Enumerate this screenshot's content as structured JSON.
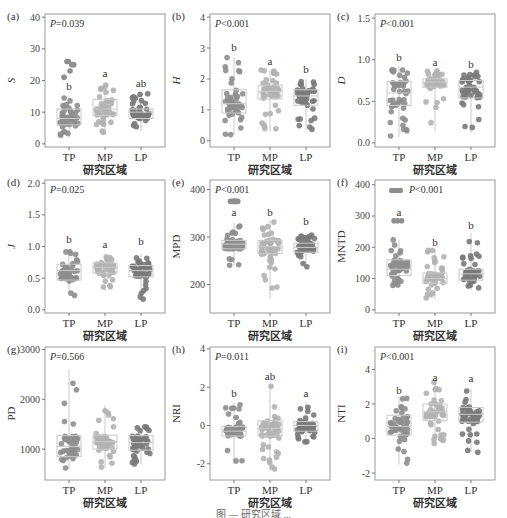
{
  "figure": {
    "xlabel": "研究区域",
    "groups": [
      "TP",
      "MP",
      "LP"
    ],
    "colors": {
      "TP": "#8e8e8e",
      "MP": "#b3b3b3",
      "LP": "#7a7a7a",
      "box": "#c9c9c9",
      "frame": "#9a9a9a"
    }
  },
  "chart_data": [
    {
      "panel": "(a)",
      "type": "box",
      "ylabel": "S",
      "ylabel_italic": true,
      "ylim": [
        -1,
        41
      ],
      "yticks": [
        0,
        10,
        20,
        30,
        40
      ],
      "yticklabels": [
        "0",
        "10",
        "20",
        "30",
        "40"
      ],
      "pvalue": "P=0.039",
      "categories": [
        "TP",
        "MP",
        "LP"
      ],
      "letters": [
        "b",
        "a",
        "ab"
      ],
      "letter_y": [
        17,
        21,
        18
      ],
      "box": [
        {
          "q1": 6,
          "median": 8,
          "q3": 11,
          "min": 2,
          "max": 15
        },
        {
          "q1": 9,
          "median": 11,
          "q3": 14,
          "min": 3,
          "max": 19
        },
        {
          "q1": 8,
          "median": 10,
          "q3": 11,
          "min": 4,
          "max": 16
        }
      ],
      "outliers": [
        [
          21,
          23,
          25,
          26,
          26,
          25
        ],
        [],
        []
      ]
    },
    {
      "panel": "(b)",
      "type": "box",
      "ylabel": "H",
      "ylabel_italic": true,
      "ylim": [
        -0.2,
        4.1
      ],
      "yticks": [
        0,
        1,
        2,
        3,
        4
      ],
      "yticklabels": [
        "0",
        "1",
        "2",
        "3",
        "4"
      ],
      "pvalue": "P<0.001",
      "categories": [
        "TP",
        "MP",
        "LP"
      ],
      "letters": [
        "b",
        "a",
        "b"
      ],
      "letter_y": [
        2.9,
        2.45,
        2.2
      ],
      "box": [
        {
          "q1": 0.9,
          "median": 1.2,
          "q3": 1.65,
          "min": 0.2,
          "max": 2.7
        },
        {
          "q1": 1.35,
          "median": 1.6,
          "q3": 1.8,
          "min": 0.3,
          "max": 2.3
        },
        {
          "q1": 1.15,
          "median": 1.45,
          "q3": 1.65,
          "min": 0.35,
          "max": 2.0
        }
      ],
      "outliers": [
        [],
        [],
        []
      ]
    },
    {
      "panel": "(c)",
      "type": "box",
      "ylabel": "D",
      "ylabel_italic": true,
      "ylim": [
        -0.05,
        1.55
      ],
      "yticks": [
        0.0,
        0.5,
        1.0,
        1.5
      ],
      "yticklabels": [
        "0.0",
        "0.5",
        "1.0",
        "1.5"
      ],
      "pvalue": "P<0.001",
      "categories": [
        "TP",
        "MP",
        "LP"
      ],
      "letters": [
        "b",
        "a",
        "b"
      ],
      "letter_y": [
        0.98,
        0.93,
        0.9
      ],
      "box": [
        {
          "q1": 0.45,
          "median": 0.6,
          "q3": 0.74,
          "min": 0.07,
          "max": 0.92
        },
        {
          "q1": 0.67,
          "median": 0.73,
          "q3": 0.77,
          "min": 0.14,
          "max": 0.87
        },
        {
          "q1": 0.54,
          "median": 0.67,
          "q3": 0.75,
          "min": 0.12,
          "max": 0.85
        }
      ],
      "outliers": [
        [],
        [],
        []
      ]
    },
    {
      "panel": "(d)",
      "type": "box",
      "ylabel": "J",
      "ylabel_italic": true,
      "ylim": [
        -0.05,
        2.05
      ],
      "yticks": [
        0.0,
        0.5,
        1.0,
        1.5,
        2.0
      ],
      "yticklabels": [
        "0.0",
        "0.5",
        "1.0",
        "1.5",
        "2.0"
      ],
      "pvalue": "P=0.025",
      "categories": [
        "TP",
        "MP",
        "LP"
      ],
      "letters": [
        "b",
        "a",
        "b"
      ],
      "letter_y": [
        1.05,
        0.97,
        1.02
      ],
      "box": [
        {
          "q1": 0.47,
          "median": 0.62,
          "q3": 0.72,
          "min": 0.22,
          "max": 0.92
        },
        {
          "q1": 0.58,
          "median": 0.67,
          "q3": 0.74,
          "min": 0.3,
          "max": 0.85
        },
        {
          "q1": 0.52,
          "median": 0.62,
          "q3": 0.7,
          "min": 0.15,
          "max": 0.88
        }
      ],
      "outliers": [
        [],
        [],
        []
      ]
    },
    {
      "panel": "(e)",
      "type": "box",
      "ylabel": "MPD",
      "ylabel_italic": false,
      "ylim": [
        140,
        420
      ],
      "yticks": [
        200,
        300,
        400
      ],
      "yticklabels": [
        "200",
        "300",
        "400"
      ],
      "pvalue": "P<0.001",
      "categories": [
        "TP",
        "MP",
        "LP"
      ],
      "letters": [
        "a",
        "b",
        "b"
      ],
      "letter_y": [
        345,
        345,
        325
      ],
      "box": [
        {
          "q1": 275,
          "median": 285,
          "q3": 293,
          "min": 240,
          "max": 330
        },
        {
          "q1": 265,
          "median": 280,
          "q3": 293,
          "min": 170,
          "max": 335
        },
        {
          "q1": 268,
          "median": 278,
          "q3": 287,
          "min": 232,
          "max": 305
        }
      ],
      "outliers": [
        [
          375,
          375,
          375,
          375,
          375,
          375
        ],
        [],
        []
      ]
    },
    {
      "panel": "(f)",
      "type": "box",
      "ylabel": "MNTD",
      "ylabel_italic": false,
      "ylim": [
        -10,
        415
      ],
      "yticks": [
        0,
        100,
        200,
        300,
        400
      ],
      "yticklabels": [
        "0",
        "100",
        "200",
        "300",
        "400"
      ],
      "pvalue": "P<0.001",
      "legend_marker": true,
      "categories": [
        "TP",
        "MP",
        "LP"
      ],
      "letters": [
        "a",
        "b",
        "b"
      ],
      "letter_y": [
        300,
        205,
        260
      ],
      "box": [
        {
          "q1": 110,
          "median": 130,
          "q3": 160,
          "min": 75,
          "max": 225
        },
        {
          "q1": 85,
          "median": 100,
          "q3": 118,
          "min": 35,
          "max": 195
        },
        {
          "q1": 95,
          "median": 115,
          "q3": 130,
          "min": 62,
          "max": 245
        }
      ],
      "outliers": [
        [
          285,
          285,
          285
        ],
        [],
        []
      ]
    },
    {
      "panel": "(g)",
      "type": "box",
      "ylabel": "PD",
      "ylabel_italic": false,
      "ylim": [
        380,
        3050
      ],
      "yticks": [
        1000,
        2000,
        3000
      ],
      "yticklabels": [
        "1000",
        "2000",
        "3000"
      ],
      "pvalue": "P=0.566",
      "categories": [
        "TP",
        "MP",
        "LP"
      ],
      "letters": [
        "",
        "",
        ""
      ],
      "letter_y": [
        0,
        0,
        0
      ],
      "box": [
        {
          "q1": 850,
          "median": 1050,
          "q3": 1270,
          "min": 600,
          "max": 2600
        },
        {
          "q1": 1000,
          "median": 1150,
          "q3": 1280,
          "min": 620,
          "max": 1880
        },
        {
          "q1": 980,
          "median": 1130,
          "q3": 1270,
          "min": 700,
          "max": 1450
        }
      ],
      "outliers": [
        [],
        [],
        []
      ]
    },
    {
      "panel": "(h)",
      "type": "box",
      "ylabel": "NRI",
      "ylabel_italic": false,
      "ylim": [
        -2.85,
        4.1
      ],
      "yticks": [
        -2,
        0,
        2,
        4
      ],
      "yticklabels": [
        "-2",
        "0",
        "2",
        "4"
      ],
      "pvalue": "P=0.011",
      "categories": [
        "TP",
        "MP",
        "LP"
      ],
      "letters": [
        "b",
        "ab",
        "a"
      ],
      "letter_y": [
        1.5,
        2.35,
        1.5
      ],
      "box": [
        {
          "q1": -0.55,
          "median": -0.3,
          "q3": -0.05,
          "min": -2.0,
          "max": 1.2
        },
        {
          "q1": -0.55,
          "median": -0.15,
          "q3": 0.25,
          "min": -2.4,
          "max": 2.1
        },
        {
          "q1": -0.3,
          "median": 0.0,
          "q3": 0.2,
          "min": -1.0,
          "max": 1.2
        }
      ],
      "outliers": [
        [],
        [],
        []
      ]
    },
    {
      "panel": "(i)",
      "type": "box",
      "ylabel": "NTI",
      "ylabel_italic": false,
      "ylim": [
        -2.4,
        5.3
      ],
      "yticks": [
        -2,
        0,
        2,
        4
      ],
      "yticklabels": [
        "-2",
        "0",
        "2",
        "4"
      ],
      "pvalue": "P<0.001",
      "categories": [
        "TP",
        "MP",
        "LP"
      ],
      "letters": [
        "b",
        "a",
        "a"
      ],
      "letter_y": [
        2.6,
        3.35,
        3.3
      ],
      "box": [
        {
          "q1": 0.2,
          "median": 0.7,
          "q3": 1.35,
          "min": -1.5,
          "max": 2.4
        },
        {
          "q1": 1.05,
          "median": 1.55,
          "q3": 2.0,
          "min": -0.3,
          "max": 3.3
        },
        {
          "q1": 0.95,
          "median": 1.4,
          "q3": 1.8,
          "min": -0.8,
          "max": 2.85
        }
      ],
      "outliers": [
        [],
        [],
        []
      ]
    }
  ],
  "caption": "图 — 研究区域 ..."
}
